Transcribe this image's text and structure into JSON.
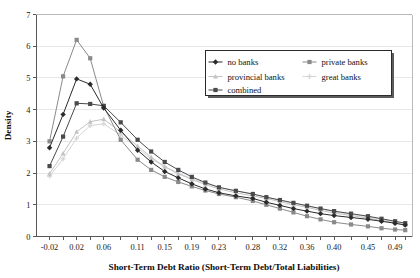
{
  "chart_data": {
    "type": "line",
    "title": "",
    "xlabel": "Short-Term Debt Ratio (Short-Term Debt/Total Liabilities)",
    "ylabel": "Density",
    "xlim": [
      -0.04,
      0.515
    ],
    "ylim": [
      0,
      7
    ],
    "yticks": [
      0,
      1,
      2,
      3,
      4,
      5,
      6,
      7
    ],
    "ytick_labels": [
      "0",
      "1",
      "2",
      "3",
      "4",
      "5",
      "6",
      "7"
    ],
    "x": [
      -0.02,
      0.0,
      0.02,
      0.04,
      0.06,
      0.085,
      0.11,
      0.13,
      0.15,
      0.17,
      0.19,
      0.21,
      0.23,
      0.255,
      0.28,
      0.3,
      0.32,
      0.34,
      0.36,
      0.38,
      0.4,
      0.425,
      0.45,
      0.47,
      0.49,
      0.505
    ],
    "xtick_labels": [
      "-0.02",
      "0.02",
      "0.06",
      "0.11",
      "0.15",
      "0.19",
      "0.23",
      "0.28",
      "0.32",
      "0.36",
      "0.40",
      "0.45",
      "0.49"
    ],
    "xtick_values": [
      -0.02,
      0.02,
      0.06,
      0.11,
      0.15,
      0.19,
      0.23,
      0.28,
      0.32,
      0.36,
      0.4,
      0.45,
      0.49
    ],
    "grid": true,
    "legend_position": "upper-right",
    "series": [
      {
        "name": "no banks",
        "color": "#2b2b2b",
        "marker": "diamond",
        "values": [
          2.8,
          3.85,
          4.97,
          4.8,
          4.05,
          3.35,
          2.72,
          2.35,
          2.05,
          1.85,
          1.66,
          1.5,
          1.38,
          1.28,
          1.2,
          1.08,
          0.98,
          0.88,
          0.8,
          0.72,
          0.66,
          0.6,
          0.54,
          0.48,
          0.42,
          0.36
        ]
      },
      {
        "name": "private banks",
        "color": "#8a8a8c",
        "marker": "square",
        "values": [
          3.0,
          5.05,
          6.2,
          5.62,
          4.1,
          3.05,
          2.42,
          2.1,
          1.88,
          1.72,
          1.58,
          1.45,
          1.34,
          1.24,
          1.12,
          1.0,
          0.88,
          0.76,
          0.64,
          0.54,
          0.45,
          0.38,
          0.32,
          0.26,
          0.22,
          0.2
        ]
      },
      {
        "name": "provincial banks",
        "color": "#c3c3c5",
        "marker": "triangle",
        "values": [
          1.98,
          2.62,
          3.3,
          3.62,
          3.7,
          3.3,
          2.85,
          2.5,
          2.2,
          1.98,
          1.8,
          1.64,
          1.5,
          1.38,
          1.28,
          1.2,
          1.1,
          1.0,
          0.92,
          0.82,
          0.74,
          0.66,
          0.58,
          0.5,
          0.42,
          0.36
        ]
      },
      {
        "name": "great banks",
        "color": "#d5d5d7",
        "marker": "cross",
        "values": [
          1.9,
          2.45,
          3.1,
          3.5,
          3.55,
          3.2,
          2.78,
          2.45,
          2.2,
          2.0,
          1.82,
          1.68,
          1.55,
          1.44,
          1.34,
          1.24,
          1.14,
          1.05,
          0.96,
          0.87,
          0.78,
          0.7,
          0.62,
          0.54,
          0.46,
          0.4
        ]
      },
      {
        "name": "combined",
        "color": "#4a4a4c",
        "marker": "square",
        "values": [
          2.22,
          3.15,
          4.2,
          4.18,
          4.12,
          3.6,
          3.05,
          2.68,
          2.35,
          2.1,
          1.88,
          1.7,
          1.55,
          1.44,
          1.34,
          1.24,
          1.15,
          1.06,
          0.97,
          0.88,
          0.8,
          0.72,
          0.64,
          0.56,
          0.48,
          0.42
        ]
      }
    ]
  }
}
